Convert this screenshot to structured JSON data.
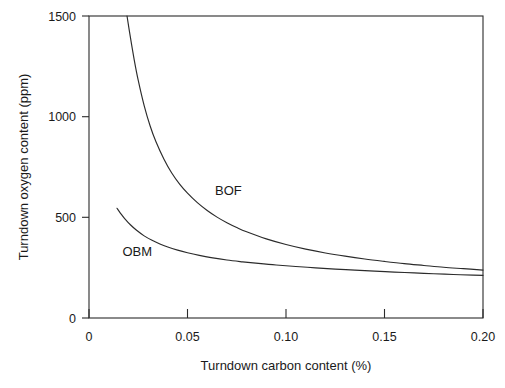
{
  "chart_data": {
    "type": "line",
    "title": "",
    "xlabel": "Turndown carbon content (%)",
    "ylabel": "Turndown oxygen content (ppm)",
    "xlim": [
      0,
      0.2
    ],
    "ylim": [
      0,
      1500
    ],
    "xticks": [
      0,
      0.05,
      0.1,
      0.15,
      0.2
    ],
    "xtick_labels": [
      "0",
      "0.05",
      "0.10",
      "0.15",
      "0.20"
    ],
    "yticks": [
      0,
      500,
      1000,
      1500
    ],
    "ytick_labels": [
      "0",
      "500",
      "1000",
      "1500"
    ],
    "grid": false,
    "legend": "inline-annotations",
    "annotations": [
      {
        "text": "BOF",
        "x": 0.064,
        "y": 610
      },
      {
        "text": "OBM",
        "x": 0.017,
        "y": 310
      }
    ],
    "series": [
      {
        "name": "BOF",
        "label": "BOF",
        "color": "#2b2b2b",
        "x": [
          0.0193,
          0.021,
          0.023,
          0.025,
          0.028,
          0.031,
          0.034,
          0.038,
          0.042,
          0.046,
          0.05,
          0.055,
          0.06,
          0.065,
          0.07,
          0.075,
          0.08,
          0.09,
          0.1,
          0.11,
          0.12,
          0.13,
          0.14,
          0.15,
          0.16,
          0.17,
          0.18,
          0.19,
          0.2
        ],
        "y": [
          1500,
          1395,
          1280,
          1180,
          1055,
          955,
          875,
          790,
          720,
          665,
          620,
          573,
          534,
          501,
          473,
          449,
          428,
          393,
          365,
          342,
          323,
          307,
          293,
          281,
          270,
          261,
          252,
          245,
          238
        ],
        "y_values_ppm": [
          1500,
          1395,
          1280,
          1180,
          1055,
          955,
          875,
          790,
          720,
          665,
          620,
          573,
          534,
          501,
          473,
          449,
          428,
          393,
          365,
          342,
          323,
          307,
          293,
          281,
          270,
          261,
          252,
          245,
          238
        ]
      },
      {
        "name": "OBM",
        "label": "OBM",
        "color": "#2b2b2b",
        "x": [
          0.0142,
          0.016,
          0.018,
          0.021,
          0.024,
          0.028,
          0.032,
          0.036,
          0.04,
          0.045,
          0.05,
          0.056,
          0.062,
          0.07,
          0.078,
          0.086,
          0.095,
          0.105,
          0.115,
          0.125,
          0.135,
          0.145,
          0.155,
          0.165,
          0.175,
          0.185,
          0.195,
          0.2
        ],
        "y": [
          545,
          520,
          495,
          463,
          437,
          408,
          386,
          368,
          353,
          337,
          324,
          311,
          300,
          288,
          279,
          271,
          263,
          256,
          249,
          243,
          238,
          233,
          228,
          224,
          220,
          216,
          213,
          212
        ]
      }
    ],
    "notes": {
      "description": "Two decaying hyperbolic curves showing turndown oxygen content versus turndown carbon content for BOF and OBM steelmaking processes.",
      "crossover_x": 0.163,
      "crossover_y": 268
    }
  },
  "axes": {
    "x_title": "Turndown carbon content (%)",
    "y_title": "Turndown oxygen content (ppm)",
    "x_tick_labels": [
      "0",
      "0.05",
      "0.10",
      "0.15",
      "0.20"
    ],
    "y_tick_labels": [
      "0",
      "500",
      "1000",
      "1500"
    ]
  },
  "annotations": {
    "bof_label": "BOF",
    "obm_label": "OBM"
  },
  "style": {
    "line_color": "#2b2b2b",
    "axis_color": "#2b2b2b",
    "background": "#ffffff",
    "text_color": "#1a1a1a"
  }
}
